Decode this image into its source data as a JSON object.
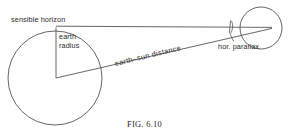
{
  "figure": {
    "caption_prefix": "F",
    "caption_small": "IG.",
    "caption_number": " 6.10",
    "caption_full": "FIG. 6.10"
  },
  "labels": {
    "sensible_horizon": "sensible horizon",
    "earth_radius_line1": "earth",
    "earth_radius_line2": "radius",
    "earth_sun_distance": "earth–sun  distance",
    "hor_parallax": "hor. parallax"
  },
  "colors": {
    "stroke": "#4a4a4a",
    "text": "#2b2b2b",
    "background": "#ffffff"
  },
  "geometry": {
    "earth_circle": {
      "cx": 55,
      "cy": 78,
      "r": 47
    },
    "sun_circle": {
      "cx": 261,
      "cy": 28,
      "r": 21
    },
    "earth_radius_line": {
      "x1": 56,
      "y1": 27,
      "x2": 56,
      "y2": 78
    },
    "horizon_line": {
      "x1": 56,
      "y1": 26,
      "x2": 272,
      "y2": 27
    },
    "earth_sun_line": {
      "x1": 56,
      "y1": 78,
      "x2": 272,
      "y2": 28
    },
    "parallax_arc": {
      "cx": 261,
      "cy": 28,
      "r": 31
    }
  }
}
